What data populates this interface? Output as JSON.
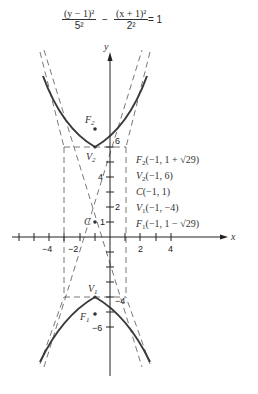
{
  "equation": {
    "term1_numerator": "(y − 1)²",
    "term1_denominator": "5²",
    "operator": "−",
    "term2_numerator": "(x + 1)²",
    "term2_denominator": "2²",
    "equals": "= 1"
  },
  "axes": {
    "x_label": "x",
    "y_label": "y",
    "x_ticks": [
      "−4",
      "−2",
      "2",
      "4"
    ],
    "y_ticks": [
      "6",
      "4",
      "2",
      "1",
      "−4",
      "−6"
    ]
  },
  "points": {
    "F2": {
      "label": "F",
      "sub": "2"
    },
    "V2": {
      "label": "V",
      "sub": "2"
    },
    "C": {
      "label": "C"
    },
    "V1": {
      "label": "V",
      "sub": "1"
    },
    "F1": {
      "label": "F",
      "sub": "1"
    }
  },
  "info_lines": [
    {
      "name": "F",
      "sub": "2",
      "coords": "(−1, 1 + √29)"
    },
    {
      "name": "V",
      "sub": "2",
      "coords": "(−1, 6)"
    },
    {
      "name": "C",
      "sub": "",
      "coords": "(−1, 1)"
    },
    {
      "name": "V",
      "sub": "1",
      "coords": "(−1, −4)"
    },
    {
      "name": "F",
      "sub": "1",
      "coords": "(−1, 1 − √29)"
    }
  ],
  "colors": {
    "curve": "#3a3a3a",
    "axis": "#222222",
    "dashed": "#555555",
    "text": "#333333"
  }
}
